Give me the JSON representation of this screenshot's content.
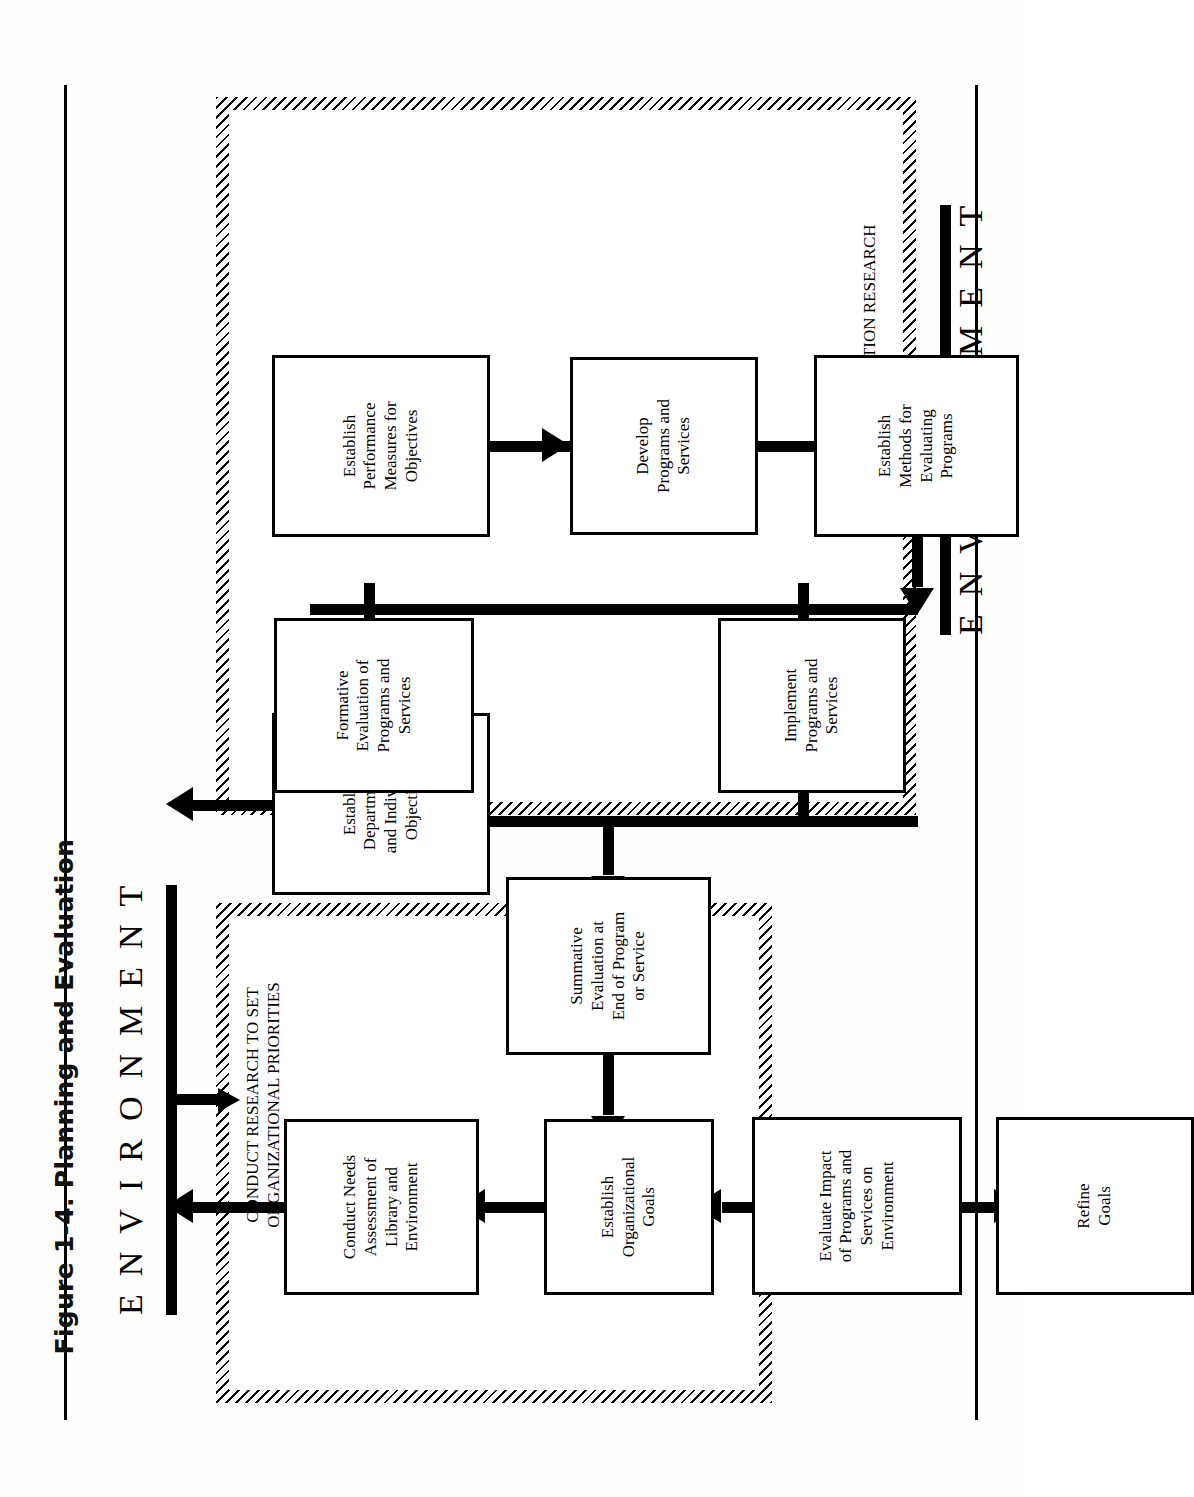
{
  "figure": {
    "caption": "Figure 1-4.   Planning and Evaluation"
  },
  "diagram": {
    "type": "flowchart",
    "environment_top_label": "ENVIRONMENT",
    "environment_bottom_label": "ENVIRONMENT",
    "regions": [
      {
        "id": "research",
        "label": "CONDUCT RESEARCH TO SET\nORGANIZATIONAL PRIORITIES"
      },
      {
        "id": "evaluation",
        "label": "CONDUCT EVALUATION RESEARCH"
      }
    ],
    "nodes": [
      {
        "id": "goals",
        "label": "Establish\nOrganizational\nGoals"
      },
      {
        "id": "needs",
        "label": "Conduct Needs\nAssessment of\nLibrary and\nEnvironment"
      },
      {
        "id": "objectives",
        "label": "Establish\nDepartmental\nand Individual\nObjectives"
      },
      {
        "id": "measures",
        "label": "Establish\nPerformance\nMeasures for\nObjectives"
      },
      {
        "id": "develop",
        "label": "Develop\nPrograms and\nServices"
      },
      {
        "id": "methods",
        "label": "Establish\nMethods for\nEvaluating\nPrograms"
      },
      {
        "id": "implement",
        "label": "Implement\nPrograms and\nServices"
      },
      {
        "id": "formative",
        "label": "Formative\nEvaluation of\nPrograms and\nServices"
      },
      {
        "id": "summative",
        "label": "Summative\nEvaluation at\nEnd of Program\nor Service"
      },
      {
        "id": "impact",
        "label": "Evaluate Impact\nof Programs and\nServices on\nEnvironment"
      },
      {
        "id": "refine",
        "label": "Refine\nGoals"
      }
    ],
    "edges": [
      {
        "from": "goals",
        "to": "needs"
      },
      {
        "from": "needs",
        "to": "objectives"
      },
      {
        "from": "objectives",
        "to": "measures"
      },
      {
        "from": "measures",
        "to": "develop"
      },
      {
        "from": "develop",
        "to": "methods"
      },
      {
        "from": "methods",
        "to": "implement"
      },
      {
        "from": "methods",
        "to": "formative"
      },
      {
        "from": "implement",
        "to": "summative"
      },
      {
        "from": "formative",
        "to": "summative"
      },
      {
        "from": "summative",
        "to": "impact"
      },
      {
        "from": "impact",
        "to": "refine"
      },
      {
        "from": "refine",
        "to": "goals"
      },
      {
        "from": "environment_bottom",
        "to": "refine"
      },
      {
        "from": "environment_top",
        "to": "develop"
      }
    ]
  },
  "colors": {
    "ink": "#000000",
    "paper": "#ffffff"
  }
}
